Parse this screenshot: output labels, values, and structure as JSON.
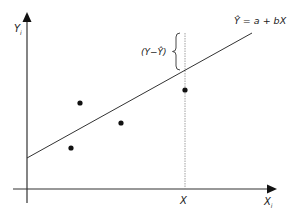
{
  "diagram": {
    "type": "regression-residual",
    "colors": {
      "axis": "#333333",
      "line": "#333333",
      "point": "#111111",
      "guide": "#888888",
      "text": "#222222"
    },
    "axes": {
      "y_label": "Y",
      "y_subscript": "i",
      "x_label": "X",
      "x_subscript": "i"
    },
    "regression_equation": "Ŷ = a + bX",
    "residual_label": "(Y−Ŷ)",
    "x_marker_label": "X",
    "points": [
      {
        "x": 80,
        "y": 103
      },
      {
        "x": 121,
        "y": 123
      },
      {
        "x": 71,
        "y": 148
      },
      {
        "x": 185,
        "y": 90
      }
    ],
    "regression_line": {
      "x1": 27,
      "y1": 158,
      "x2": 252,
      "y2": 33
    },
    "vertical_guide": {
      "x": 185,
      "y1": 33,
      "y2": 189
    },
    "residual_brace": {
      "x": 178,
      "y1": 33,
      "y2": 70
    }
  }
}
